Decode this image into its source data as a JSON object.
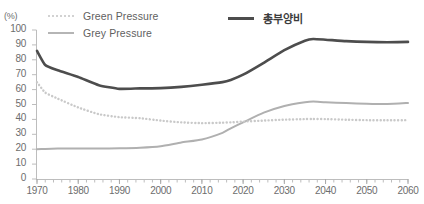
{
  "chart_data": {
    "type": "line",
    "title": "",
    "subtitle": "",
    "xlabel": "",
    "ylabel": "",
    "unit_label": "(%)",
    "xlim": [
      1970,
      2060
    ],
    "ylim": [
      0,
      100
    ],
    "xticks": [
      1970,
      1980,
      1990,
      2000,
      2010,
      2020,
      2030,
      2040,
      2050,
      2060
    ],
    "yticks": [
      0,
      10,
      20,
      30,
      40,
      50,
      60,
      70,
      80,
      90,
      100
    ],
    "minor_xtick_interval": 2,
    "grid": false,
    "legend_position": "top",
    "x": [
      1970,
      1972,
      1975,
      1980,
      1985,
      1990,
      1995,
      2000,
      2005,
      2010,
      2015,
      2017,
      2020,
      2025,
      2030,
      2035,
      2037,
      2040,
      2045,
      2050,
      2055,
      2060
    ],
    "series": [
      {
        "name": "총부양비",
        "style": "solid",
        "color": "#4d4d4d",
        "width": 2.6,
        "values": [
          86.0,
          76.5,
          73.0,
          68.5,
          63.0,
          60.5,
          60.8,
          61.0,
          61.8,
          63.2,
          65.0,
          66.5,
          70.0,
          78.0,
          86.5,
          92.8,
          94.0,
          93.5,
          92.5,
          92.0,
          91.8,
          92.0
        ]
      },
      {
        "name": "Green Pressure",
        "style": "dotted",
        "color": "#c9c9c9",
        "width": 2.4,
        "values": [
          65.0,
          58.0,
          54.0,
          48.0,
          43.5,
          41.5,
          40.8,
          39.2,
          38.0,
          37.5,
          37.8,
          38.0,
          38.5,
          39.2,
          39.8,
          40.2,
          40.3,
          40.2,
          39.8,
          39.5,
          39.4,
          39.5
        ]
      },
      {
        "name": "Grey Pressure",
        "style": "solid",
        "color": "#b0b0b0",
        "width": 2.0,
        "values": [
          20.0,
          20.2,
          20.4,
          20.5,
          20.5,
          20.6,
          21.0,
          22.0,
          24.5,
          26.5,
          31.0,
          34.0,
          38.0,
          44.5,
          49.0,
          51.5,
          52.0,
          51.5,
          51.0,
          50.5,
          50.3,
          51.0
        ]
      }
    ],
    "legend": [
      {
        "label": "Green Pressure",
        "swatch": "dotted",
        "color": "#d2d2d2"
      },
      {
        "label": "Grey Pressure",
        "swatch": "solid",
        "color": "#b5b5b5"
      },
      {
        "label": "총부양비",
        "swatch": "thick",
        "color": "#4d4d4d"
      }
    ]
  },
  "axes": {
    "unit": "(%)",
    "y_labels": [
      "100",
      "90",
      "80",
      "70",
      "60",
      "50",
      "40",
      "30",
      "20",
      "10",
      "0"
    ],
    "x_labels": [
      "1970",
      "1980",
      "1990",
      "2000",
      "2010",
      "2020",
      "2030",
      "2040",
      "2050",
      "2060"
    ]
  }
}
